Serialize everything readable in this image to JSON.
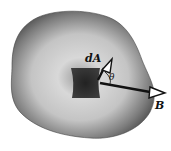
{
  "diagram": {
    "labels": {
      "area_element": "dA",
      "angle": "θ",
      "field": "B"
    },
    "colors": {
      "surface_edge": "#3a3a3a",
      "surface_center": "#e6e6e6",
      "patch": "#2e2e2e",
      "arrow": "#111111",
      "arrowhead_fill": "#ffffff"
    }
  }
}
